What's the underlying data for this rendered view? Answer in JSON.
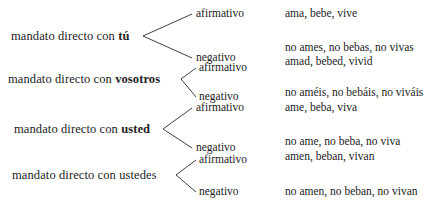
{
  "diagram": {
    "title": "mandato directo",
    "groups": [
      {
        "label_prefix": "mandato directo con ",
        "keyword": "tú",
        "keyword_bold": true,
        "branches": [
          {
            "label": "afirmativo",
            "example": "ama, bebe, vive"
          },
          {
            "label": "negativo",
            "example": "no ames, no bebas, no vivas"
          }
        ]
      },
      {
        "label_prefix": "mandato directo con ",
        "keyword": "vosotros",
        "keyword_bold": true,
        "branches": [
          {
            "label": "afirmativo",
            "example": "amad, bebed, vivid"
          },
          {
            "label": "negativo",
            "example": "no améis, no bebáis, no viváis"
          }
        ]
      },
      {
        "label_prefix": "mandato directo con ",
        "keyword": "usted",
        "keyword_bold": true,
        "branches": [
          {
            "label": "afirmativo",
            "example": "ame, beba, viva"
          },
          {
            "label": "negativo",
            "example": "no ame, no beba, no viva"
          }
        ]
      },
      {
        "label_prefix": "mandato directo con ",
        "keyword": "ustedes",
        "keyword_bold": false,
        "branches": [
          {
            "label": "afirmativo",
            "example": "amen, beban, vivan"
          },
          {
            "label": "negativo",
            "example": "no amen, no beban, no vivan"
          }
        ]
      }
    ]
  },
  "colors": {
    "background": "#ffffff",
    "text": "#232323",
    "line": "#2b2b2b"
  }
}
